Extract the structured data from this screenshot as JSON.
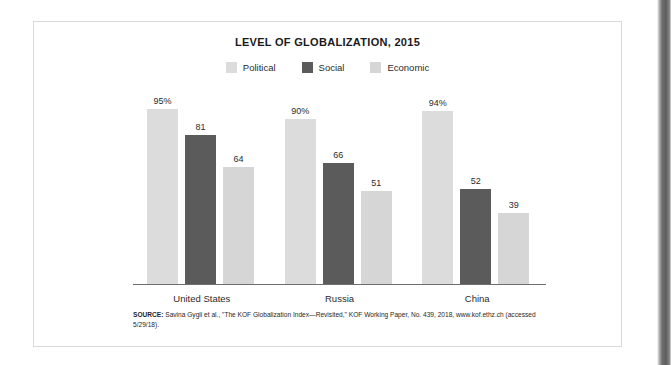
{
  "figure": {
    "title": "LEVEL OF GLOBALIZATION, 2015",
    "source_prefix": "SOURCE:",
    "source_text": " Savina Gygli et al., \"The KOF Globalization Index—Revisited,\" KOF Working Paper, No. 439, 2018, www.kof.ethz.ch (accessed 5/29/18)."
  },
  "colors": {
    "political": "#dcdcdc",
    "social": "#5b5b5b",
    "economic": "#d6d6d6",
    "axis": "#6e6e6e",
    "border": "#d9d9d9",
    "text": "#2b2b2b"
  },
  "chart_data": {
    "type": "bar",
    "title": "LEVEL OF GLOBALIZATION, 2015",
    "xlabel": "",
    "ylabel": "",
    "ylim": [
      0,
      100
    ],
    "grid": false,
    "legend_position": "top-center",
    "categories": [
      "United States",
      "Russia",
      "China"
    ],
    "series": [
      {
        "name": "Political",
        "color": "#dcdcdc",
        "values": [
          95,
          90,
          94
        ],
        "labels": [
          "95%",
          "90%",
          "94%"
        ]
      },
      {
        "name": "Social",
        "color": "#5b5b5b",
        "values": [
          81,
          66,
          52
        ],
        "labels": [
          "81",
          "66",
          "52"
        ]
      },
      {
        "name": "Economic",
        "color": "#d6d6d6",
        "values": [
          64,
          51,
          39
        ],
        "labels": [
          "64",
          "51",
          "39"
        ]
      }
    ]
  }
}
